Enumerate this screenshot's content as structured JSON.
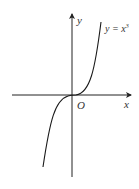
{
  "diagram": {
    "type": "function-graph",
    "function": "y = x^3",
    "labels": {
      "curve": "y = x",
      "curve_exponent": "3",
      "x_axis": "x",
      "y_axis": "y",
      "origin": "O"
    },
    "colors": {
      "axis": "#222222",
      "curve": "#1a1a1a",
      "text": "#333333"
    }
  }
}
